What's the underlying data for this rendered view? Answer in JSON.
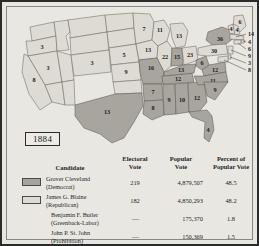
{
  "map": {
    "title_year": "1884",
    "legend_colors": {
      "democrat": "#a7a49d",
      "republican": "#dedbd4"
    },
    "states": [
      {
        "name": "Oregon",
        "abbr": "OR",
        "votes": "3",
        "party": "republican"
      },
      {
        "name": "Nevada",
        "abbr": "NV",
        "votes": "3",
        "party": "republican"
      },
      {
        "name": "California",
        "abbr": "CA",
        "votes": "8",
        "party": "republican"
      },
      {
        "name": "Colorado",
        "abbr": "CO",
        "votes": "3",
        "party": "republican"
      },
      {
        "name": "Nebraska",
        "abbr": "NE",
        "votes": "5",
        "party": "republican"
      },
      {
        "name": "Kansas",
        "abbr": "KS",
        "votes": "9",
        "party": "republican"
      },
      {
        "name": "Minnesota",
        "abbr": "MN",
        "votes": "7",
        "party": "republican"
      },
      {
        "name": "Iowa",
        "abbr": "IA",
        "votes": "13",
        "party": "republican"
      },
      {
        "name": "Wisconsin",
        "abbr": "WI",
        "votes": "11",
        "party": "republican"
      },
      {
        "name": "Michigan",
        "abbr": "MI",
        "votes": "13",
        "party": "republican"
      },
      {
        "name": "Illinois",
        "abbr": "IL",
        "votes": "22",
        "party": "republican"
      },
      {
        "name": "Indiana",
        "abbr": "IN",
        "votes": "15",
        "party": "democrat"
      },
      {
        "name": "Ohio",
        "abbr": "OH",
        "votes": "23",
        "party": "republican"
      },
      {
        "name": "Missouri",
        "abbr": "MO",
        "votes": "16",
        "party": "democrat"
      },
      {
        "name": "Arkansas",
        "abbr": "AR",
        "votes": "7",
        "party": "democrat"
      },
      {
        "name": "Texas",
        "abbr": "TX",
        "votes": "13",
        "party": "democrat"
      },
      {
        "name": "Louisiana",
        "abbr": "LA",
        "votes": "8",
        "party": "democrat"
      },
      {
        "name": "Mississippi",
        "abbr": "MS",
        "votes": "9",
        "party": "democrat"
      },
      {
        "name": "Alabama",
        "abbr": "AL",
        "votes": "10",
        "party": "democrat"
      },
      {
        "name": "Georgia",
        "abbr": "GA",
        "votes": "12",
        "party": "democrat"
      },
      {
        "name": "Tennessee",
        "abbr": "TN",
        "votes": "12",
        "party": "democrat"
      },
      {
        "name": "Kentucky",
        "abbr": "KY",
        "votes": "13",
        "party": "democrat"
      },
      {
        "name": "West Virginia",
        "abbr": "WV",
        "votes": "6",
        "party": "democrat"
      },
      {
        "name": "Virginia",
        "abbr": "VA",
        "votes": "12",
        "party": "democrat"
      },
      {
        "name": "North Carolina",
        "abbr": "NC",
        "votes": "11",
        "party": "democrat"
      },
      {
        "name": "South Carolina",
        "abbr": "SC",
        "votes": "9",
        "party": "democrat"
      },
      {
        "name": "Florida",
        "abbr": "FL",
        "votes": "4",
        "party": "democrat"
      },
      {
        "name": "New York",
        "abbr": "NY",
        "votes": "36",
        "party": "democrat"
      },
      {
        "name": "Pennsylvania",
        "abbr": "PA",
        "votes": "30",
        "party": "republican"
      },
      {
        "name": "Maine",
        "abbr": "ME",
        "votes": "6",
        "party": "republican"
      },
      {
        "name": "Vermont",
        "abbr": "VT",
        "votes": "4",
        "party": "republican"
      },
      {
        "name": "New Hampshire",
        "abbr": "NH",
        "votes": "4",
        "party": "republican"
      }
    ],
    "callouts": [
      {
        "label": "14",
        "state": "Massachusetts"
      },
      {
        "label": "4",
        "state": "Rhode Island"
      },
      {
        "label": "6",
        "state": "Connecticut"
      },
      {
        "label": "9",
        "state": "New Jersey"
      },
      {
        "label": "3",
        "state": "Delaware"
      },
      {
        "label": "8",
        "state": "Maryland"
      }
    ]
  },
  "table": {
    "headers": {
      "candidate": "Candidate",
      "electoral_vote": "Electoral\nVote",
      "electoral_vote_l1": "Electoral",
      "electoral_vote_l2": "Vote",
      "popular_vote_l1": "Popular",
      "popular_vote_l2": "Vote",
      "percent_l1": "Percent of",
      "percent_l2": "Popular Vote"
    },
    "rows": [
      {
        "name": "Grover Cleveland",
        "party": "(Democrat)",
        "electoral_vote": "219",
        "popular_vote": "4,879,507",
        "percent": "48.5",
        "swatch": "democrat"
      },
      {
        "name": "James G. Blaine",
        "party": "(Republican)",
        "electoral_vote": "182",
        "popular_vote": "4,850,293",
        "percent": "48.2",
        "swatch": "republican"
      },
      {
        "name": "Benjamin F. Butler",
        "party": "(Greenback-Labor)",
        "electoral_vote": "—",
        "popular_vote": "175,370",
        "percent": "1.8",
        "swatch": "none"
      },
      {
        "name": "John P. St. John",
        "party": "(Prohibition)",
        "electoral_vote": "—",
        "popular_vote": "150,369",
        "percent": "1.5",
        "swatch": "none"
      }
    ]
  }
}
